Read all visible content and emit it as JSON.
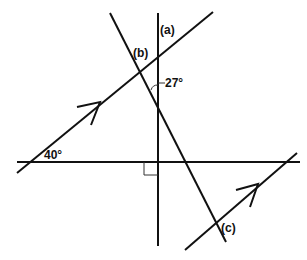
{
  "diagram": {
    "title": "",
    "labels": {
      "a": "(a)",
      "b": "(b)",
      "c": "(c)",
      "angle_27": "27°",
      "angle_40": "40°"
    },
    "colors": {
      "line": "#111111",
      "background": "#ffffff"
    },
    "elements": [
      {
        "type": "line",
        "name": "vertical-line",
        "from": [
          158,
          13
        ],
        "to": [
          158,
          246
        ]
      },
      {
        "type": "line",
        "name": "horizontal-line",
        "from": [
          17,
          162
        ],
        "to": [
          300,
          162
        ]
      },
      {
        "type": "line",
        "name": "parallel-line-upper",
        "from": [
          17,
          173
        ],
        "to": [
          213,
          12
        ],
        "arrow": true
      },
      {
        "type": "line",
        "name": "transversal-steep",
        "from": [
          110,
          13
        ],
        "to": [
          226,
          242
        ]
      },
      {
        "type": "line",
        "name": "parallel-line-lower",
        "from": [
          185,
          250
        ],
        "to": [
          297,
          153
        ],
        "arrow": true
      },
      {
        "type": "right-angle",
        "at": [
          158,
          162
        ]
      },
      {
        "type": "angle-arc",
        "value": "27°",
        "between": [
          "vertical-line",
          "transversal-steep"
        ]
      },
      {
        "type": "angle",
        "value": "40°",
        "between": [
          "parallel-line-upper",
          "horizontal-line"
        ]
      }
    ]
  }
}
